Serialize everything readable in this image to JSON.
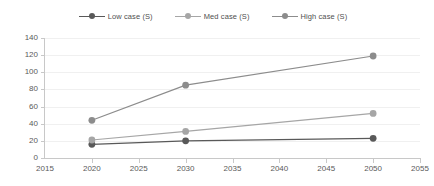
{
  "chart_data": {
    "type": "line",
    "title": "",
    "xlabel": "",
    "ylabel": "",
    "x": [
      2020,
      2030,
      2050
    ],
    "xlim": [
      2015,
      2055
    ],
    "ylim": [
      0,
      140
    ],
    "xticks": [
      2015,
      2020,
      2025,
      2030,
      2035,
      2040,
      2045,
      2050,
      2055
    ],
    "yticks": [
      0,
      20,
      40,
      60,
      80,
      100,
      120,
      140
    ],
    "xtick_labels": [
      "2015",
      "2020",
      "2025",
      "2030",
      "2035",
      "2040",
      "2045",
      "2050",
      "2055"
    ],
    "ytick_labels": [
      "0",
      "20",
      "40",
      "60",
      "80",
      "100",
      "120",
      "140"
    ],
    "grid": "horizontal",
    "legend_position": "top-center",
    "series": [
      {
        "name": "Low case (S)",
        "color": "#595959",
        "marker": "circle",
        "values": [
          16,
          20,
          23
        ]
      },
      {
        "name": "Med case (S)",
        "color": "#a6a6a6",
        "marker": "circle",
        "values": [
          21,
          31,
          52
        ]
      },
      {
        "name": "High case (S)",
        "color": "#8c8c8c",
        "marker": "circle",
        "values": [
          44,
          85,
          119
        ]
      }
    ]
  },
  "legend": {
    "items": [
      {
        "label": "Low case (S)"
      },
      {
        "label": "Med case (S)"
      },
      {
        "label": "High case (S)"
      }
    ]
  }
}
